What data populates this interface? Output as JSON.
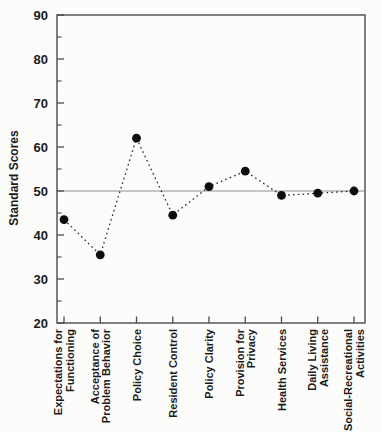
{
  "chart_data": {
    "type": "line",
    "title": "",
    "xlabel": "",
    "ylabel": "Standard Scores",
    "ylim": [
      20,
      90
    ],
    "ytick_major_step": 10,
    "ytick_minor_step": 5,
    "ytick_labels": [
      "90",
      "80",
      "70",
      "60",
      "50",
      "40",
      "30",
      "20"
    ],
    "ytick_values": [
      90,
      80,
      70,
      60,
      50,
      40,
      30,
      20
    ],
    "reference_line_value": 50,
    "grid": "off",
    "legend": "none",
    "marker": "filled-circle",
    "line_style": "dotted",
    "categories": [
      "Expectations for Functioning",
      "Acceptance of Problem Behavior",
      "Policy Choice",
      "Resident Control",
      "Policy Clarity",
      "Provision for Privacy",
      "Health Services",
      "Daily Living Assistance",
      "Social-Recreational Activities"
    ],
    "category_label_lines": [
      [
        "Expectations for",
        "Functioning"
      ],
      [
        "Acceptance of",
        "Problem Behavior"
      ],
      [
        "Policy Choice"
      ],
      [
        "Resident Control"
      ],
      [
        "Policy Clarity"
      ],
      [
        "Provision for",
        "Privacy"
      ],
      [
        "Health Services"
      ],
      [
        "Daily Living",
        "Assistance"
      ],
      [
        "Social-Recreational",
        "Activities"
      ]
    ],
    "values": [
      43.5,
      35.5,
      62,
      44.5,
      51,
      54.5,
      49,
      49.5,
      50
    ],
    "colors": {
      "marker": "#0d0d0d",
      "line": "#2a2a2a",
      "axis": "#4a4a4a",
      "reference": "#8f8f8f",
      "text": "#1b1b1b",
      "background": "#fcfcfa"
    }
  }
}
